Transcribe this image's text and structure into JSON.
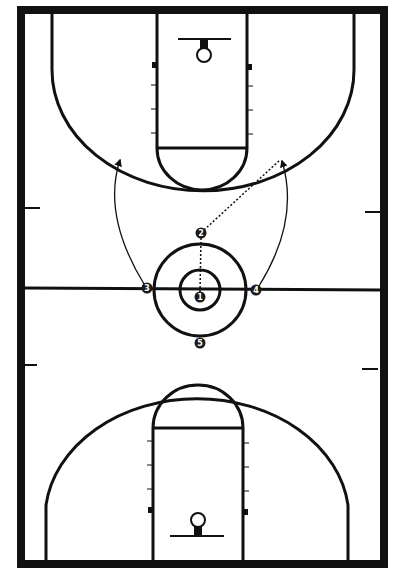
{
  "diagram": {
    "type": "basketball-full-court-play",
    "colors": {
      "line": "#111111",
      "background": "#ffffff",
      "player_fill": "#1a1a1a",
      "player_text": "#ffffff"
    },
    "players": [
      {
        "id": "1",
        "label": "1",
        "x": 200,
        "y": 297
      },
      {
        "id": "2",
        "label": "2",
        "x": 201,
        "y": 233
      },
      {
        "id": "3",
        "label": "3",
        "x": 147,
        "y": 288
      },
      {
        "id": "4",
        "label": "4",
        "x": 256,
        "y": 290
      },
      {
        "id": "5",
        "label": "5",
        "x": 200,
        "y": 343
      }
    ],
    "actions": [
      {
        "type": "pass",
        "style": "dotted",
        "from": "1",
        "to": "2"
      },
      {
        "type": "pass",
        "style": "dotted",
        "from": "2",
        "to_point": [
          280,
          160
        ]
      },
      {
        "type": "cut",
        "style": "solid-arrow",
        "from": "3",
        "to_point": [
          120,
          160
        ]
      },
      {
        "type": "cut",
        "style": "solid-arrow",
        "from": "4",
        "to_point": [
          282,
          161
        ]
      }
    ]
  }
}
